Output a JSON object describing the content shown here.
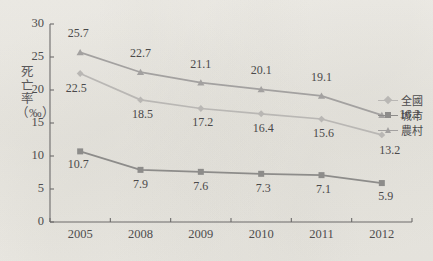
{
  "chart_data": {
    "type": "line",
    "title": "",
    "subtitle": "",
    "xlabel": "",
    "ylabel": "死亡率（‰）",
    "categories": [
      "2005",
      "2008",
      "2009",
      "2010",
      "2011",
      "2012"
    ],
    "ylim": [
      0,
      30
    ],
    "yticks": [
      0,
      5,
      10,
      15,
      20,
      25,
      30
    ],
    "grid": false,
    "legend_position": "right",
    "series": [
      {
        "name": "全國",
        "marker": "diamond",
        "color": "#b9b7b4",
        "values": [
          22.5,
          18.5,
          17.2,
          16.4,
          15.6,
          13.2
        ],
        "labels": [
          "22.5",
          "18.5",
          "17.2",
          "16.4",
          "15.6",
          "13.2"
        ]
      },
      {
        "name": "城市",
        "marker": "square",
        "color": "#8d8c8a",
        "values": [
          10.7,
          7.9,
          7.6,
          7.3,
          7.1,
          5.9
        ],
        "labels": [
          "10.7",
          "7.9",
          "7.6",
          "7.3",
          "7.1",
          "5.9"
        ]
      },
      {
        "name": "農村",
        "marker": "triangle",
        "color": "#a3a1a0",
        "values": [
          25.7,
          22.7,
          21.1,
          20.1,
          19.1,
          16.2
        ],
        "labels": [
          "25.7",
          "22.7",
          "21.1",
          "20.1",
          "19.1",
          "16.2"
        ]
      }
    ],
    "axis_color": "#6c6b6b",
    "background_color": "#f4f2ed"
  }
}
